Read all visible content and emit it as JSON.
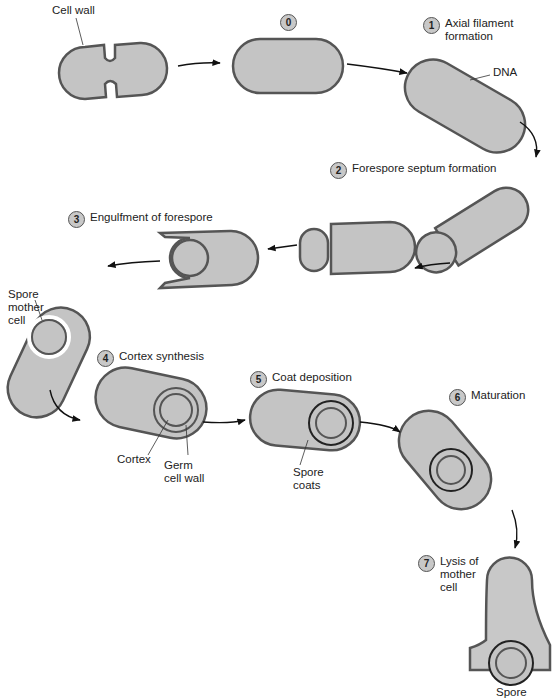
{
  "labels": {
    "cell_wall": "Cell wall",
    "dna": "DNA",
    "spore_mother_cell": "Spore\nmother\ncell",
    "cortex": "Cortex",
    "germ_cell_wall": "Germ\ncell wall",
    "spore_coats": "Spore\ncoats",
    "spore": "Spore"
  },
  "steps": [
    {
      "num": "0",
      "text": ""
    },
    {
      "num": "1",
      "text": "Axial filament\nformation"
    },
    {
      "num": "2",
      "text": "Forespore septum formation"
    },
    {
      "num": "3",
      "text": "Engulfment of forespore"
    },
    {
      "num": "4",
      "text": "Cortex synthesis"
    },
    {
      "num": "5",
      "text": "Coat deposition"
    },
    {
      "num": "6",
      "text": "Maturation"
    },
    {
      "num": "7",
      "text": "Lysis of\nmother\ncell"
    }
  ],
  "colors": {
    "cell_fill": "#c4c4c4",
    "outline": "#555555",
    "badge": "#c8c8c8"
  }
}
